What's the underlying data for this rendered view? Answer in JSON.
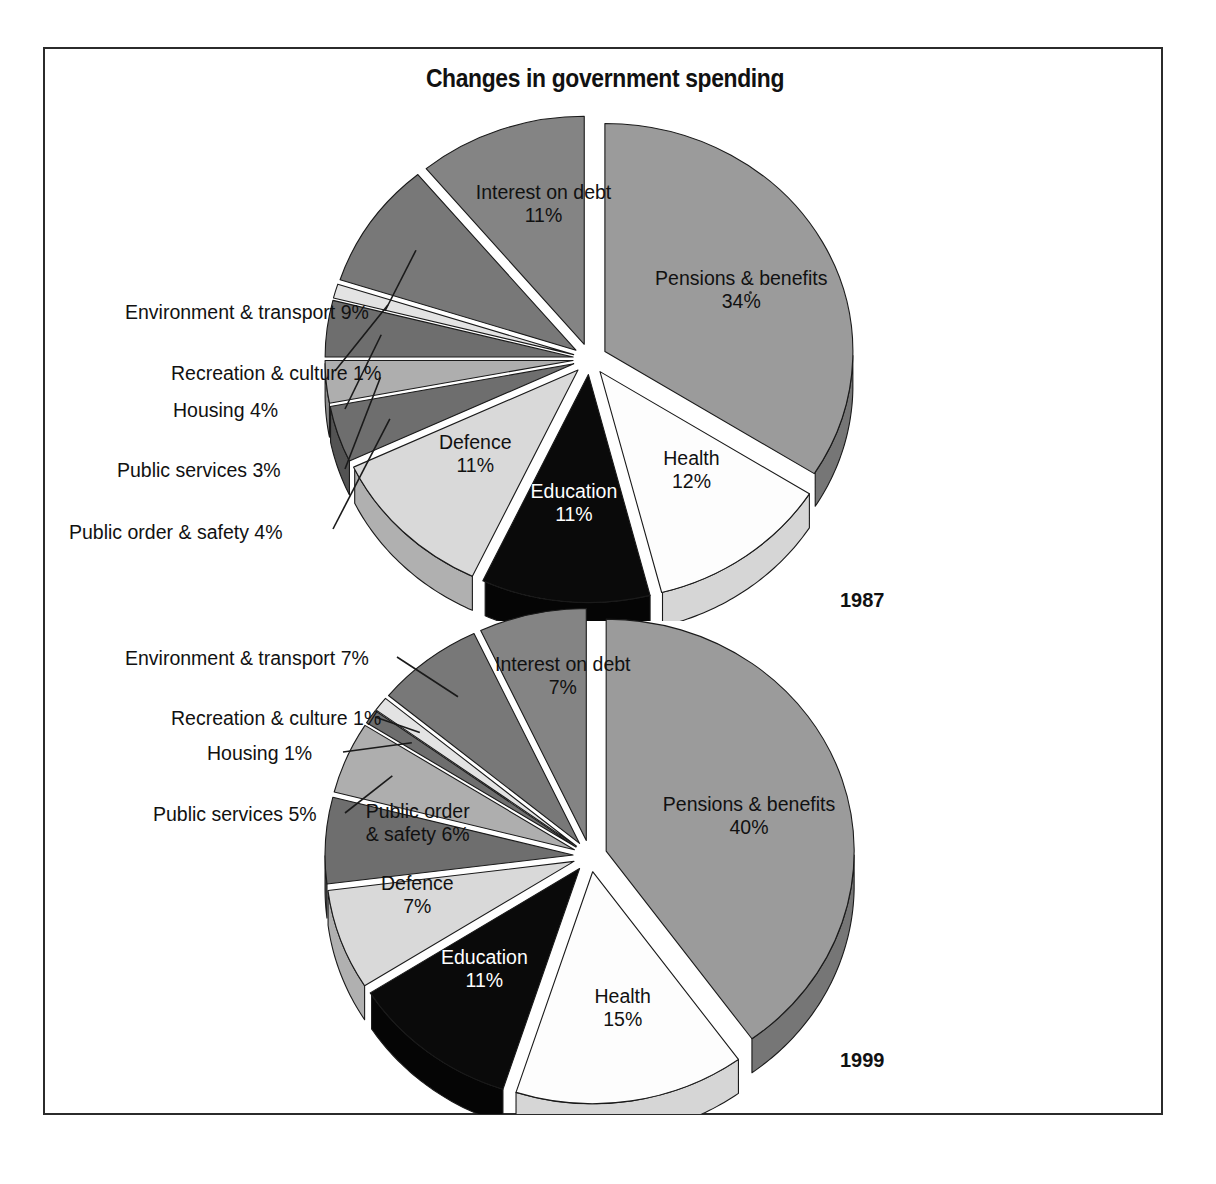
{
  "figure": {
    "title": "Changes in government spending",
    "border_color": "#2b2b2b",
    "background": "#ffffff"
  },
  "chart_data": [
    {
      "type": "pie",
      "title": "1987",
      "year": "1987",
      "style": "3d-exploded-pie",
      "total": 100,
      "units": "%",
      "categories": [
        "Pensions & benefits",
        "Health",
        "Education",
        "Defence",
        "Public order & safety",
        "Public services",
        "Housing",
        "Recreation & culture",
        "Environment & transport",
        "Interest on debt"
      ],
      "values": [
        34,
        12,
        11,
        11,
        4,
        3,
        4,
        1,
        9,
        11
      ],
      "slices": [
        {
          "label": "Pensions & benefits",
          "value": 34,
          "display": "34%",
          "text": "Pensions & benefits\n34%",
          "color": "#9b9b9b",
          "side_color": "#767676",
          "label_placement": "inside",
          "text_color": "#111111"
        },
        {
          "label": "Health",
          "value": 12,
          "display": "12%",
          "text": "Health\n12%",
          "color": "#fdfdfd",
          "side_color": "#d6d6d6",
          "label_placement": "inside",
          "text_color": "#111111"
        },
        {
          "label": "Education",
          "value": 11,
          "display": "11%",
          "text": "Education\n11%",
          "color": "#0a0a0a",
          "side_color": "#050505",
          "label_placement": "inside",
          "text_color": "#ffffff"
        },
        {
          "label": "Defence",
          "value": 11,
          "display": "11%",
          "text": "Defence\n11%",
          "color": "#d9d9d9",
          "side_color": "#b0b0b0",
          "label_placement": "inside",
          "text_color": "#111111"
        },
        {
          "label": "Public order & safety",
          "value": 4,
          "display": "4%",
          "text": "Public order & safety 4%",
          "color": "#6e6e6e",
          "side_color": "#535353",
          "label_placement": "callout-left",
          "text_color": "#111111"
        },
        {
          "label": "Public services",
          "value": 3,
          "display": "3%",
          "text": "Public services 3%",
          "color": "#aeaeae",
          "side_color": "#8a8a8a",
          "label_placement": "callout-left",
          "text_color": "#111111"
        },
        {
          "label": "Housing",
          "value": 4,
          "display": "4%",
          "text": "Housing 4%",
          "color": "#6e6e6e",
          "side_color": "#525252",
          "label_placement": "callout-left",
          "text_color": "#111111"
        },
        {
          "label": "Recreation & culture",
          "value": 1,
          "display": "1%",
          "text": "Recreation & culture 1%",
          "color": "#e3e3e3",
          "side_color": "#bdbdbd",
          "label_placement": "callout-left",
          "text_color": "#111111"
        },
        {
          "label": "Environment & transport",
          "value": 9,
          "display": "9%",
          "text": "Environment & transport 9%",
          "color": "#787878",
          "side_color": "#5c5c5c",
          "label_placement": "callout-left",
          "text_color": "#111111"
        },
        {
          "label": "Interest on debt",
          "value": 11,
          "display": "11%",
          "text": "Interest on debt\n11%",
          "color": "#848484",
          "side_color": "#636363",
          "label_placement": "inside",
          "text_color": "#111111"
        }
      ]
    },
    {
      "type": "pie",
      "title": "1999",
      "year": "1999",
      "style": "3d-exploded-pie",
      "total": 100,
      "units": "%",
      "categories": [
        "Pensions & benefits",
        "Health",
        "Education",
        "Defence",
        "Public order & safety",
        "Public services",
        "Housing",
        "Recreation & culture",
        "Environment & transport",
        "Interest on debt"
      ],
      "values": [
        40,
        15,
        11,
        7,
        6,
        5,
        1,
        1,
        7,
        7
      ],
      "slices": [
        {
          "label": "Pensions & benefits",
          "value": 40,
          "display": "40%",
          "text": "Pensions & benefits\n40%",
          "color": "#9b9b9b",
          "side_color": "#767676",
          "label_placement": "inside",
          "text_color": "#111111"
        },
        {
          "label": "Health",
          "value": 15,
          "display": "15%",
          "text": "Health\n15%",
          "color": "#fdfdfd",
          "side_color": "#d6d6d6",
          "label_placement": "inside",
          "text_color": "#111111"
        },
        {
          "label": "Education",
          "value": 11,
          "display": "11%",
          "text": "Education\n11%",
          "color": "#0a0a0a",
          "side_color": "#050505",
          "label_placement": "inside",
          "text_color": "#ffffff"
        },
        {
          "label": "Defence",
          "value": 7,
          "display": "7%",
          "text": "Defence\n7%",
          "color": "#d9d9d9",
          "side_color": "#b0b0b0",
          "label_placement": "inside",
          "text_color": "#111111"
        },
        {
          "label": "Public order & safety",
          "value": 6,
          "display": "6%",
          "text": "Public order\n& safety 6%",
          "color": "#6e6e6e",
          "side_color": "#535353",
          "label_placement": "inside",
          "text_color": "#111111"
        },
        {
          "label": "Public services",
          "value": 5,
          "display": "5%",
          "text": "Public services 5%",
          "color": "#aeaeae",
          "side_color": "#8a8a8a",
          "label_placement": "callout-left",
          "text_color": "#111111"
        },
        {
          "label": "Housing",
          "value": 1,
          "display": "1%",
          "text": "Housing 1%",
          "color": "#6e6e6e",
          "side_color": "#525252",
          "label_placement": "callout-left",
          "text_color": "#111111"
        },
        {
          "label": "Recreation & culture",
          "value": 1,
          "display": "1%",
          "text": "Recreation & culture 1%",
          "color": "#e3e3e3",
          "side_color": "#bdbdbd",
          "label_placement": "callout-left",
          "text_color": "#111111"
        },
        {
          "label": "Environment & transport",
          "value": 7,
          "display": "7%",
          "text": "Environment & transport 7%",
          "color": "#787878",
          "side_color": "#5c5c5c",
          "label_placement": "callout-left",
          "text_color": "#111111"
        },
        {
          "label": "Interest on debt",
          "value": 7,
          "display": "7%",
          "text": "Interest on debt\n7%",
          "color": "#848484",
          "side_color": "#636363",
          "label_placement": "inside",
          "text_color": "#111111"
        }
      ]
    }
  ],
  "callouts_1987": [
    {
      "id": "environment-transport",
      "text": "Environment & transport 9%"
    },
    {
      "id": "recreation-culture",
      "text": "Recreation & culture 1%"
    },
    {
      "id": "housing",
      "text": "Housing 4%"
    },
    {
      "id": "public-services",
      "text": "Public services 3%"
    },
    {
      "id": "public-order-safety",
      "text": "Public order & safety 4%"
    }
  ],
  "callouts_1999": [
    {
      "id": "environment-transport",
      "text": "Environment & transport 7%"
    },
    {
      "id": "recreation-culture",
      "text": "Recreation & culture 1%"
    },
    {
      "id": "housing",
      "text": "Housing 1%"
    },
    {
      "id": "public-services",
      "text": "Public services 5%"
    }
  ],
  "years": {
    "first": "1987",
    "second": "1999"
  }
}
